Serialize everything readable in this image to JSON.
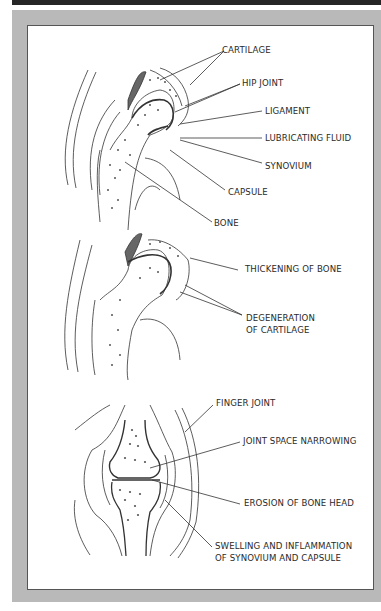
{
  "figure": {
    "frame_color": "#b9b9b9",
    "top_bar_color": "#262626",
    "line_color": "#333333"
  },
  "hip_normal": {
    "labels": [
      {
        "id": "cartilage",
        "text": "CARTILAGE"
      },
      {
        "id": "hip-joint",
        "text": "HIP JOINT"
      },
      {
        "id": "ligament",
        "text": "LIGAMENT"
      },
      {
        "id": "lubricating-fluid",
        "text": "LUBRICATING FLUID"
      },
      {
        "id": "synovium",
        "text": "SYNOVIUM"
      },
      {
        "id": "capsule",
        "text": "CAPSULE"
      },
      {
        "id": "bone",
        "text": "BONE"
      }
    ]
  },
  "hip_arthritic": {
    "labels": [
      {
        "id": "thickening-of-bone",
        "text": "THICKENING OF BONE"
      },
      {
        "id": "degeneration-line1",
        "text": "DEGENERATION"
      },
      {
        "id": "degeneration-line2",
        "text": "OF CARTILAGE"
      }
    ]
  },
  "finger": {
    "labels": [
      {
        "id": "finger-joint",
        "text": "FINGER JOINT"
      },
      {
        "id": "joint-space-narrowing",
        "text": "JOINT SPACE NARROWING"
      },
      {
        "id": "erosion",
        "text": "EROSION OF BONE HEAD"
      },
      {
        "id": "swelling-line1",
        "text": "SWELLING AND INFLAMMATION"
      },
      {
        "id": "swelling-line2",
        "text": "OF SYNOVIUM AND CAPSULE"
      }
    ]
  }
}
